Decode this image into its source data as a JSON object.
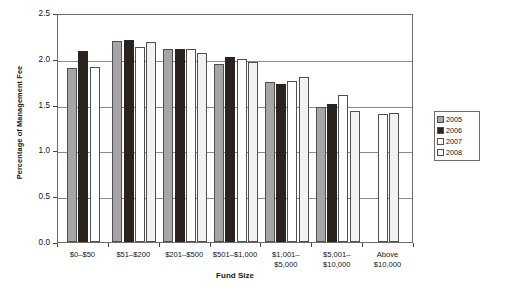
{
  "chart_data": {
    "type": "bar",
    "title": "",
    "xlabel": "Fund Size",
    "ylabel": "Percentage of Management Fee",
    "ylim": [
      0.0,
      2.5
    ],
    "yticks": [
      "0.0",
      "0.5",
      "1.0",
      "1.5",
      "2.0",
      "2.5"
    ],
    "ytick_values": [
      0.0,
      0.5,
      1.0,
      1.5,
      2.0,
      2.5
    ],
    "grid": true,
    "legend_position": "right",
    "categories": [
      "$0–$50",
      "$51–$200",
      "$201–$500",
      "$501–$1,000",
      "$1,001–\n$5,000",
      "$5,001–\n$10,000",
      "Above\n$10,000"
    ],
    "category_lines": [
      [
        "$0–$50",
        ""
      ],
      [
        "$51–$200",
        ""
      ],
      [
        "$201–$500",
        ""
      ],
      [
        "$501–$1,000",
        ""
      ],
      [
        "$1,001–",
        "$5,000"
      ],
      [
        "$5,001–",
        "$10,000"
      ],
      [
        "Above",
        "$10,000"
      ]
    ],
    "series": [
      {
        "name": "2005",
        "color": "#a6a6a6",
        "values": [
          1.9,
          2.19,
          2.11,
          1.94,
          1.75,
          1.47,
          null
        ]
      },
      {
        "name": "2006",
        "color": "#2b2320",
        "values": [
          2.09,
          2.21,
          2.11,
          2.02,
          1.73,
          1.51,
          null
        ]
      },
      {
        "name": "2007",
        "color": "#ffffff",
        "values": [
          1.91,
          2.13,
          2.11,
          2.0,
          1.76,
          1.6,
          1.4
        ]
      },
      {
        "name": "2008",
        "color": "#f2f2f2",
        "values": [
          null,
          2.18,
          2.06,
          1.96,
          1.8,
          1.43,
          1.41
        ]
      }
    ]
  },
  "legend": {
    "items": [
      {
        "label": "2005",
        "color": "#a6a6a6"
      },
      {
        "label": "2006",
        "color": "#2b2320"
      },
      {
        "label": "2007",
        "color": "#ffffff"
      },
      {
        "label": "2008",
        "color": "#f2f2f2"
      }
    ]
  }
}
